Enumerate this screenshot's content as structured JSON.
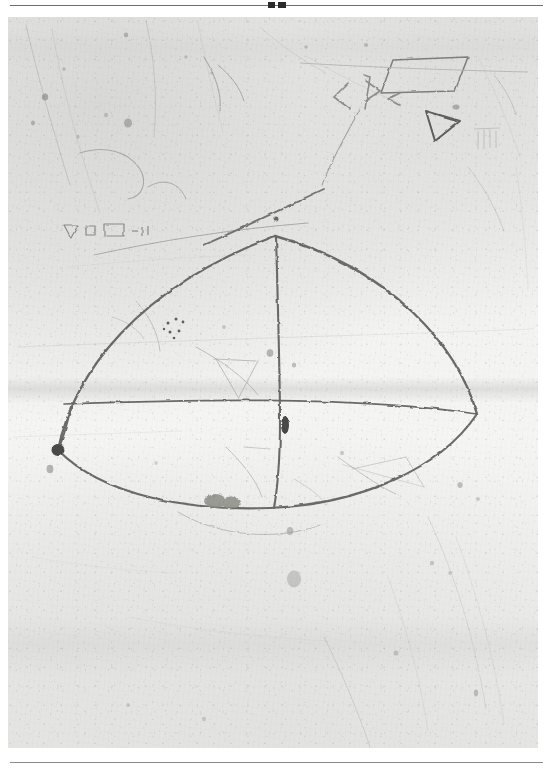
{
  "page": {
    "kind": "scanned-plate-page",
    "top_rule_mark": "double-tick-mark",
    "background_color": "#ffffff"
  },
  "plate": {
    "subject": "photograph of an incised stone surface with geometric graffiti",
    "surface_color_light": "#f5f5f4",
    "surface_color_mid": "#e4e4e2",
    "surface_color_dark": "#d2d2d0",
    "incision_color": "#5c5c5a",
    "incision_color_faint": "#a8a8a6"
  },
  "figures": {
    "main_figure_label": "large rounded-triangular outline with vertical axis and horizontal chord",
    "elements": [
      {
        "name": "left-vertex-point",
        "x": 58,
        "y": 450
      },
      {
        "name": "apex-point",
        "x": 275,
        "y": 236
      },
      {
        "name": "right-vertex-point",
        "x": 477,
        "y": 414
      },
      {
        "name": "axis-chord-intersection",
        "x": 277,
        "y": 403
      },
      {
        "name": "bottom-arc-low-point",
        "x": 268,
        "y": 507
      }
    ]
  },
  "marks": {
    "parallelogram": "incised parallelogram, upper right",
    "triangle_outline": "incised triangle outline, upper right",
    "chevron_group": "group of chevron / arrow strokes, upper centre-right",
    "small_glyph_row": "row of small incised glyphs (triangle, square, rectangle), upper left",
    "dot_cluster": "cluster of small drilled dots, left of centre",
    "dark_smudge": "dark smudge on lower arc",
    "pit_left": "dark drilled pit at left vertex",
    "pit_centre": "dark pit on vertical axis"
  }
}
